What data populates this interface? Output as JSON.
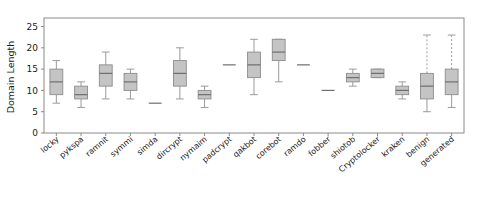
{
  "chart_data": {
    "type": "box",
    "title": "",
    "xlabel": "",
    "ylabel": "Domain Length",
    "ylim": [
      0,
      27
    ],
    "yticks": [
      0,
      5,
      10,
      15,
      20,
      25
    ],
    "grid": false,
    "legend": "none",
    "box_fill_color": "#c4c4c4",
    "box_edge_color": "#8c8c8c",
    "median_color": "#6e6e6e",
    "whisker_color": "#9a9a9a",
    "axis_color": "#8a8a8a",
    "categories": [
      "locky",
      "pykspa",
      "ramnit",
      "symmi",
      "simda",
      "dircrypt",
      "nymaim",
      "padcrypt",
      "qakbot",
      "corebot",
      "ramdo",
      "fobber",
      "shiotob",
      "Cryptolocker",
      "kraken",
      "benign",
      "generated"
    ],
    "boxes": [
      {
        "label": "locky",
        "whisker_low": 7,
        "q1": 9,
        "median": 12,
        "q3": 15,
        "whisker_high": 17,
        "dashed_high": false
      },
      {
        "label": "pykspa",
        "whisker_low": 6,
        "q1": 8,
        "median": 9,
        "q3": 11,
        "whisker_high": 12,
        "dashed_high": false
      },
      {
        "label": "ramnit",
        "whisker_low": 8,
        "q1": 11,
        "median": 14,
        "q3": 16,
        "whisker_high": 19,
        "dashed_high": false
      },
      {
        "label": "symmi",
        "whisker_low": 8,
        "q1": 10,
        "median": 12,
        "q3": 14,
        "whisker_high": 15,
        "dashed_high": false
      },
      {
        "label": "simda",
        "whisker_low": 7,
        "q1": 7,
        "median": 7,
        "q3": 7,
        "whisker_high": 7,
        "dashed_high": false
      },
      {
        "label": "dircrypt",
        "whisker_low": 8,
        "q1": 11,
        "median": 14,
        "q3": 17,
        "whisker_high": 20,
        "dashed_high": false
      },
      {
        "label": "nymaim",
        "whisker_low": 6,
        "q1": 8,
        "median": 9,
        "q3": 10,
        "whisker_high": 11,
        "dashed_high": false
      },
      {
        "label": "padcrypt",
        "whisker_low": 16,
        "q1": 16,
        "median": 16,
        "q3": 16,
        "whisker_high": 16,
        "dashed_high": false
      },
      {
        "label": "qakbot",
        "whisker_low": 9,
        "q1": 13,
        "median": 16,
        "q3": 19,
        "whisker_high": 22,
        "dashed_high": false
      },
      {
        "label": "corebot",
        "whisker_low": 12,
        "q1": 17,
        "median": 19,
        "q3": 22,
        "whisker_high": 22,
        "dashed_high": false
      },
      {
        "label": "ramdo",
        "whisker_low": 16,
        "q1": 16,
        "median": 16,
        "q3": 16,
        "whisker_high": 16,
        "dashed_high": false
      },
      {
        "label": "fobber",
        "whisker_low": 10,
        "q1": 10,
        "median": 10,
        "q3": 10,
        "whisker_high": 10,
        "dashed_high": false
      },
      {
        "label": "shiotob",
        "whisker_low": 11,
        "q1": 12,
        "median": 13,
        "q3": 14,
        "whisker_high": 15,
        "dashed_high": false
      },
      {
        "label": "Cryptolocker",
        "whisker_low": 13,
        "q1": 13,
        "median": 14,
        "q3": 15,
        "whisker_high": 15,
        "dashed_high": false
      },
      {
        "label": "kraken",
        "whisker_low": 8,
        "q1": 9,
        "median": 10,
        "q3": 11,
        "whisker_high": 12,
        "dashed_high": false
      },
      {
        "label": "benign",
        "whisker_low": 5,
        "q1": 8,
        "median": 11,
        "q3": 14,
        "whisker_high": 23,
        "dashed_high": true
      },
      {
        "label": "generated",
        "whisker_low": 6,
        "q1": 9,
        "median": 12,
        "q3": 15,
        "whisker_high": 23,
        "dashed_high": true
      }
    ]
  }
}
